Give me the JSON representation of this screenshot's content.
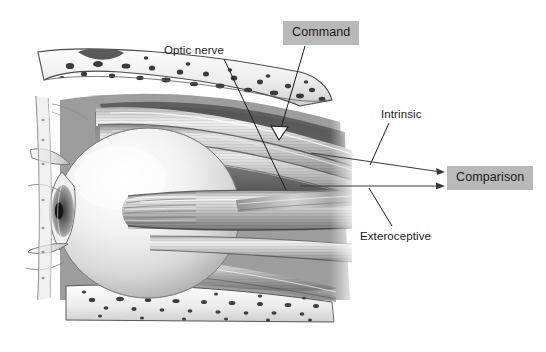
{
  "figure": {
    "kind": "anatomical-illustration",
    "background_color": "#ffffff",
    "ink_color": "#1a1a1a",
    "label_box_fill": "#b9b9b9"
  },
  "labels": {
    "command": "Command",
    "comparison": "Comparison",
    "optic_nerve": "Optic nerve",
    "intrinsic": "Intrinsic",
    "exteroceptive": "Exteroceptive"
  },
  "annotations": [
    {
      "id": "command",
      "text": "Command",
      "style": "boxed",
      "box": {
        "x": 283,
        "y": 21,
        "width": 66,
        "height": 24
      },
      "leader": {
        "from_x": 305,
        "from_y": 45,
        "to_x": 281,
        "to_y": 131
      },
      "arrowhead": "white-triangle"
    },
    {
      "id": "comparison",
      "text": "Comparison",
      "style": "boxed",
      "box": {
        "x": 447,
        "y": 166,
        "width": 80,
        "height": 24
      },
      "incoming_arrows": 2
    },
    {
      "id": "optic-nerve",
      "text": "Optic nerve",
      "style": "plain",
      "position": {
        "x": 164,
        "y": 45
      },
      "leader": {
        "from_x": 224,
        "from_y": 58,
        "to_x": 286,
        "to_y": 189
      }
    },
    {
      "id": "intrinsic",
      "text": "Intrinsic",
      "style": "plain",
      "position": {
        "x": 381,
        "y": 109
      },
      "leader": {
        "from_x": 389,
        "from_y": 122,
        "to_x": 370,
        "to_y": 164
      }
    },
    {
      "id": "exteroceptive",
      "text": "Exteroceptive",
      "style": "plain",
      "position": {
        "x": 360,
        "y": 231
      },
      "leader": {
        "from_x": 393,
        "from_y": 226,
        "to_x": 368,
        "to_y": 187
      }
    }
  ],
  "arrows": [
    {
      "id": "intrinsic-arrow",
      "from_x": 312,
      "from_y": 153,
      "to_x": 444,
      "to_y": 172,
      "label": "Intrinsic",
      "target": "Comparison"
    },
    {
      "id": "exteroceptive-arrow",
      "from_x": 300,
      "from_y": 186,
      "to_x": 444,
      "to_y": 186,
      "label": "Exteroceptive",
      "target": "Comparison"
    }
  ]
}
